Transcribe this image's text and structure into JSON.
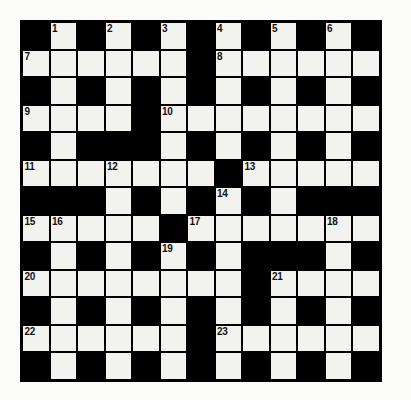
{
  "puzzle": {
    "title": "Crossword Grid",
    "rows": 13,
    "columns": 13,
    "cell_size_px": 27.5,
    "colors": {
      "block": "#000000",
      "open_cell": "#f2f2ef",
      "grid_line": "#000000",
      "number_text": "#111111",
      "page_background": "#fbfbf9"
    },
    "numbered_clues": [
      1,
      2,
      3,
      4,
      5,
      6,
      7,
      8,
      9,
      10,
      11,
      12,
      13,
      14,
      15,
      16,
      17,
      18,
      19,
      20,
      21,
      22,
      23
    ],
    "grid": [
      [
        "#",
        "1",
        "#",
        "2",
        "#",
        "3",
        "#",
        "4",
        "#",
        "5",
        "#",
        "6",
        "#"
      ],
      [
        "7",
        ".",
        ".",
        ".",
        ".",
        ".",
        "#",
        "8",
        ".",
        ".",
        ".",
        ".",
        "."
      ],
      [
        "#",
        ".",
        "#",
        ".",
        "#",
        ".",
        "#",
        ".",
        "#",
        ".",
        "#",
        ".",
        "#"
      ],
      [
        "9",
        ".",
        ".",
        ".",
        "#",
        "10",
        ".",
        ".",
        ".",
        ".",
        ".",
        ".",
        "."
      ],
      [
        "#",
        ".",
        "#",
        "#",
        "#",
        ".",
        "#",
        ".",
        "#",
        ".",
        "#",
        ".",
        "#"
      ],
      [
        "11",
        ".",
        ".",
        "12",
        ".",
        ".",
        ".",
        "#",
        "13",
        ".",
        ".",
        ".",
        "."
      ],
      [
        "#",
        "#",
        "#",
        ".",
        "#",
        ".",
        "#",
        "14",
        "#",
        ".",
        "#",
        "#",
        "#"
      ],
      [
        "15",
        "16",
        ".",
        ".",
        ".",
        "#",
        "17",
        ".",
        ".",
        ".",
        ".",
        "18",
        "."
      ],
      [
        "#",
        ".",
        "#",
        ".",
        "#",
        "19",
        "#",
        ".",
        "#",
        "#",
        "#",
        ".",
        "#"
      ],
      [
        "20",
        ".",
        ".",
        ".",
        ".",
        ".",
        ".",
        ".",
        "#",
        "21",
        ".",
        ".",
        "."
      ],
      [
        "#",
        ".",
        "#",
        ".",
        "#",
        ".",
        "#",
        ".",
        "#",
        ".",
        "#",
        ".",
        "#"
      ],
      [
        "22",
        ".",
        ".",
        ".",
        ".",
        ".",
        "#",
        "23",
        ".",
        ".",
        ".",
        ".",
        "."
      ],
      [
        "#",
        ".",
        "#",
        ".",
        "#",
        ".",
        "#",
        ".",
        "#",
        ".",
        "#",
        ".",
        "#"
      ]
    ]
  }
}
